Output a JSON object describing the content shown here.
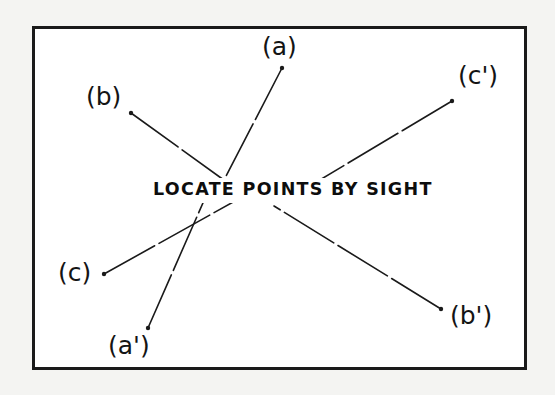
{
  "figure": {
    "caption": "LOCATE POINTS BY SIGHT",
    "background_color": "#ffffff",
    "page_color": "#f4f4f2",
    "line_color": "#1a1a1a",
    "frame_color": "#1a1a1a",
    "labels": [
      {
        "id": "a",
        "text": "(a)",
        "x": 262,
        "y": 34,
        "dot_x": 282,
        "dot_y": 68
      },
      {
        "id": "b",
        "text": "(b)",
        "x": 86,
        "y": 84,
        "dot_x": 131,
        "dot_y": 113
      },
      {
        "id": "c-prime",
        "text": "(c')",
        "x": 458,
        "y": 63,
        "dot_x": 452,
        "dot_y": 101
      },
      {
        "id": "c",
        "text": "(c)",
        "x": 58,
        "y": 260,
        "dot_x": 104,
        "dot_y": 274
      },
      {
        "id": "a-prime",
        "text": "(a')",
        "x": 108,
        "y": 333,
        "dot_x": 148,
        "dot_y": 328
      },
      {
        "id": "b-prime",
        "text": "(b')",
        "x": 450,
        "y": 303,
        "dot_x": 441,
        "dot_y": 309
      }
    ],
    "segments": [
      {
        "id": "line-a",
        "from_label": "a",
        "x1": 282,
        "y1": 68,
        "x2": 222,
        "y2": 184
      },
      {
        "id": "line-b",
        "from_label": "b",
        "x1": 131,
        "y1": 113,
        "x2": 228,
        "y2": 183
      },
      {
        "id": "line-c-prime",
        "from_label": "c-prime",
        "x1": 452,
        "y1": 101,
        "x2": 303,
        "y2": 190
      },
      {
        "id": "line-c",
        "from_label": "c",
        "x1": 104,
        "y1": 274,
        "x2": 244,
        "y2": 196
      },
      {
        "id": "line-a-prime",
        "from_label": "a-prime",
        "x1": 148,
        "y1": 328,
        "x2": 206,
        "y2": 196
      },
      {
        "id": "line-b-prime",
        "from_label": "b-prime",
        "x1": 441,
        "y1": 309,
        "x2": 274,
        "y2": 206
      }
    ],
    "frame": {
      "x": 32,
      "y": 26,
      "width": 495,
      "height": 344,
      "stroke_width": 3
    },
    "caption_position": {
      "x": 149,
      "y": 178
    }
  }
}
